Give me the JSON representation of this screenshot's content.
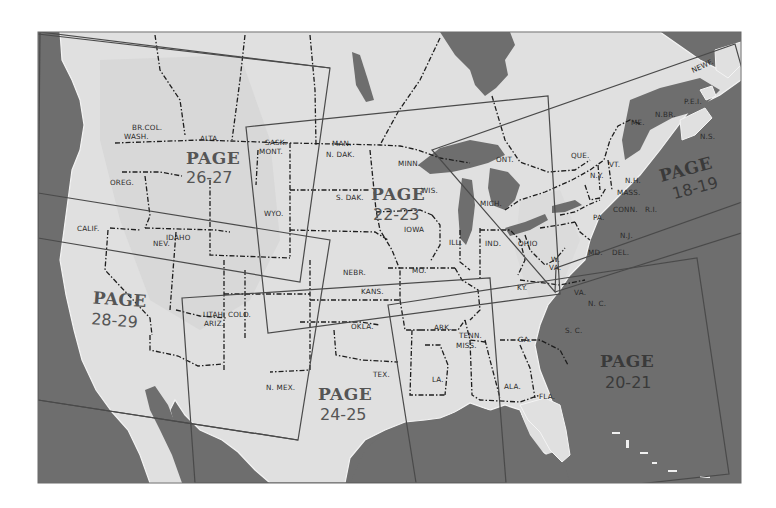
{
  "map": {
    "title": "Index map of North America with page regions",
    "colors": {
      "water": "#6e6e6e",
      "land": "#e2e2e2",
      "land_shade": "#cfcfcf",
      "border": "#1e1e1e",
      "page_frame": "#4a4a4a",
      "page_label": "#555555",
      "page_label_on_water": "#3a3a3a",
      "background": "#ffffff"
    },
    "page_regions": [
      {
        "id": "p18-19",
        "word": "PAGE",
        "number": "18-19"
      },
      {
        "id": "p20-21",
        "word": "PAGE",
        "number": "20-21"
      },
      {
        "id": "p22-23",
        "word": "PAGE",
        "number": "22-23"
      },
      {
        "id": "p24-25",
        "word": "PAGE",
        "number": "24-25"
      },
      {
        "id": "p26-27",
        "word": "PAGE",
        "number": "26-27"
      },
      {
        "id": "p28-29",
        "word": "PAGE",
        "number": "28-29"
      }
    ],
    "labels": {
      "br_col": "BR.COL.",
      "wash": "WASH.",
      "alta": "ALTA.",
      "sask": "SASK.",
      "mont": "MONT.",
      "man": "MAN.",
      "n_dak": "N. DAK.",
      "minn": "MINN.",
      "ont": "ONT.",
      "que": "QUE.",
      "newf": "NEWF.",
      "me": "ME.",
      "n_br": "N.BR.",
      "pei": "P.E.I.",
      "ns": "N.S.",
      "vt": "VT.",
      "nh": "N.H.",
      "ny": "N.Y.",
      "mass": "MASS.",
      "conn": "CONN.",
      "ri": "R.I.",
      "oreg": "OREG.",
      "idaho": "IDAHO",
      "wyo": "WYO.",
      "s_dak": "S. DAK.",
      "wis": "WIS.",
      "mich": "MICH.",
      "iowa": "IOWA",
      "pa": "PA.",
      "nj": "N.J.",
      "calif": "CALIF.",
      "nev": "NEV.",
      "ill": "ILL.",
      "ind": "IND.",
      "ohio": "OHIO",
      "md": "MD.",
      "del": "DEL.",
      "w_va": "W.",
      "w_va2": "VA.",
      "nebr": "NEBR.",
      "mo": "MO.",
      "ky": "KY.",
      "va": "VA.",
      "utah": "UTAH",
      "colo": "COLO.",
      "kans": "KANS.",
      "nc": "N. C.",
      "ariz": "ARIZ.",
      "okla": "OKLA.",
      "ark": "ARK.",
      "tenn": "TENN.",
      "sc": "S. C.",
      "miss": "MISS.",
      "ga": "GA.",
      "tex": "TEX.",
      "n_mex": "N. MEX.",
      "la": "LA.",
      "ala": "ALA.",
      "fla": "FLA."
    }
  }
}
